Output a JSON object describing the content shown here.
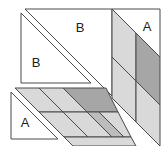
{
  "diagram": {
    "colors": {
      "white": "#ffffff",
      "light": "#d9d9d9",
      "medium": "#bcbcbc",
      "dark": "#a6a6a6",
      "stroke": "#4a4a4a"
    },
    "labels": [
      "B",
      "B",
      "A",
      "A"
    ],
    "shapes": [
      {
        "id": "triangle-b-upper",
        "fill": "white",
        "points": [
          [
            25,
            9
          ],
          [
            112,
            9
          ],
          [
            112,
            96
          ]
        ],
        "label": {
          "text": "B",
          "x": 80,
          "y": 32
        }
      },
      {
        "id": "triangle-b-lower",
        "fill": "white",
        "points": [
          [
            21,
            13
          ],
          [
            21,
            83
          ],
          [
            91,
            83
          ]
        ],
        "label": {
          "text": "B",
          "x": 36,
          "y": 67
        }
      },
      {
        "id": "strip-cell-top-left",
        "fill": "light",
        "points": [
          [
            112,
            9
          ],
          [
            136,
            33
          ],
          [
            136,
            81
          ],
          [
            112,
            57
          ]
        ]
      },
      {
        "id": "strip-cell-top-right",
        "fill": "dark",
        "points": [
          [
            136,
            33
          ],
          [
            160,
            57
          ],
          [
            160,
            105
          ],
          [
            136,
            81
          ]
        ]
      },
      {
        "id": "strip-cell-bottom-left",
        "fill": "light",
        "points": [
          [
            112,
            57
          ],
          [
            136,
            81
          ],
          [
            136,
            122
          ],
          [
            112,
            98
          ]
        ]
      },
      {
        "id": "strip-cell-bottom-right",
        "fill": "light",
        "points": [
          [
            136,
            81
          ],
          [
            160,
            105
          ],
          [
            160,
            146
          ],
          [
            136,
            122
          ]
        ]
      },
      {
        "id": "triangle-a-top-right",
        "fill": "white",
        "points": [
          [
            112,
            9
          ],
          [
            160,
            9
          ],
          [
            160,
            57
          ]
        ],
        "label": {
          "text": "A",
          "x": 147,
          "y": 31
        }
      },
      {
        "id": "grid-cell-row1-left",
        "fill": "light",
        "points": [
          [
            15,
            88
          ],
          [
            63,
            88
          ],
          [
            87,
            112
          ],
          [
            39,
            112
          ]
        ]
      },
      {
        "id": "grid-cell-row1-right",
        "fill": "dark",
        "points": [
          [
            63,
            88
          ],
          [
            106,
            88
          ],
          [
            118,
            112
          ],
          [
            87,
            112
          ]
        ]
      },
      {
        "id": "grid-cell-row2-left",
        "fill": "light",
        "points": [
          [
            39,
            112
          ],
          [
            87,
            112
          ],
          [
            112,
            137
          ],
          [
            64,
            137
          ]
        ]
      },
      {
        "id": "grid-cell-row2-mid",
        "fill": "medium",
        "points": [
          [
            87,
            112
          ],
          [
            99,
            112
          ],
          [
            124,
            137
          ],
          [
            112,
            137
          ]
        ]
      },
      {
        "id": "grid-cell-row2-right",
        "fill": "light",
        "points": [
          [
            99,
            112
          ],
          [
            118,
            112
          ],
          [
            131,
            137
          ],
          [
            124,
            137
          ]
        ]
      },
      {
        "id": "grid-cell-row3",
        "fill": "light",
        "points": [
          [
            64,
            137
          ],
          [
            131,
            137
          ],
          [
            136,
            146
          ],
          [
            73,
            146
          ]
        ]
      },
      {
        "id": "triangle-a-bottom-left",
        "fill": "white",
        "points": [
          [
            11,
            92
          ],
          [
            11,
            139
          ],
          [
            58,
            139
          ]
        ],
        "label": {
          "text": "A",
          "x": 25,
          "y": 127
        }
      }
    ],
    "dividers": [
      {
        "id": "grid-row1-divider",
        "from": [
          39,
          88
        ],
        "to": [
          63,
          112
        ]
      },
      {
        "id": "grid-row2-divider",
        "from": [
          63,
          112
        ],
        "to": [
          88,
          137
        ]
      }
    ]
  }
}
